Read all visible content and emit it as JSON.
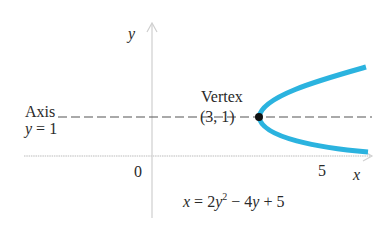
{
  "diagram": {
    "axes": {
      "x_label": "x",
      "y_label": "y",
      "origin_label": "0",
      "x_tick_label": "5"
    },
    "axis_of_symmetry": {
      "label_line1": "Axis",
      "label_line2": "y = 1"
    },
    "vertex": {
      "label_line1": "Vertex",
      "label_line2": "(3, 1)"
    },
    "equation": {
      "lhs": "x",
      "eq": " = 2",
      "var": "y",
      "exp": "2",
      "rest_op": " − 4",
      "var2": "y",
      "tail": " + 5"
    },
    "colors": {
      "curve": "#2bb3df",
      "axis": "#c8c8c8",
      "dashed": "#555555",
      "vertex_dot": "#111111",
      "text": "#2a2a2a"
    }
  }
}
